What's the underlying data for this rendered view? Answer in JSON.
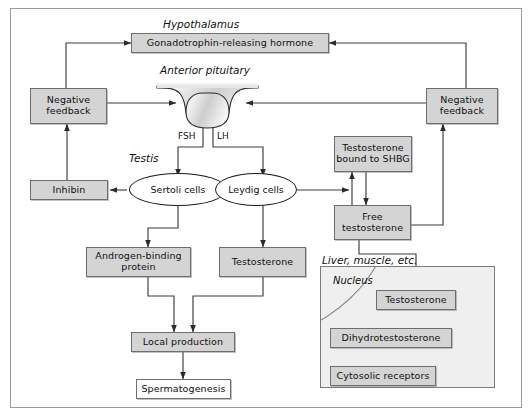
{
  "figure": {
    "frame_color": "#9a9a9a",
    "box_fill": "#d4d4d4",
    "box_stroke": "#6e6e6e",
    "line_color": "#3c3c3c"
  },
  "region_labels": {
    "hypothalamus": "Hypothalamus",
    "anterior_pituitary": "Anterior pituitary",
    "testis": "Testis",
    "liver_muscle": "Liver, muscle, etc.",
    "nucleus": "Nucleus"
  },
  "nodes": {
    "gnrh": "Gonadotrophin-releasing hormone",
    "negative_feedback_left": "Negative\nfeedback",
    "negative_feedback_left_line1": "Negative",
    "negative_feedback_left_line2": "feedback",
    "negative_feedback_right_line1": "Negative",
    "negative_feedback_right_line2": "feedback",
    "inhibin": "Inhibin",
    "sertoli_cells": "Sertoli cells",
    "leydig_cells": "Leydig cells",
    "testosterone_shbg_line1": "Testosterone",
    "testosterone_shbg_line2": "bound to SHBG",
    "free_testosterone_line1": "Free",
    "free_testosterone_line2": "testosterone",
    "androgen_binding_line1": "Androgen-binding",
    "androgen_binding_line2": "protein",
    "testosterone_testis": "Testosterone",
    "local_production": "Local production",
    "spermatogenesis": "Spermatogenesis",
    "testosterone_cell": "Testosterone",
    "dihydrotestosterone": "Dihydrotestosterone",
    "cytosolic_receptors": "Cytosolic receptors"
  },
  "edge_labels": {
    "fsh": "FSH",
    "lh": "LH"
  }
}
